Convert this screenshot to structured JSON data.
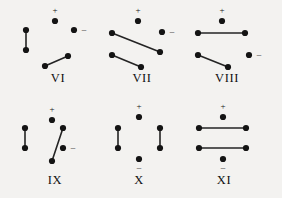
{
  "figure": {
    "background_color": "#f3f2f0",
    "ink_color": "#141414",
    "width": 282,
    "height": 198,
    "panels": [
      {
        "id": "panel-vi",
        "label": "VI",
        "label_x": 58,
        "label_y": 82,
        "plus": {
          "sign": "+",
          "sign_x": 55,
          "sign_y": 11,
          "dot_x": 55,
          "dot_y": 21
        },
        "minus": {
          "sign": "–",
          "sign_x": 84,
          "sign_y": 30,
          "dot_x": 74,
          "dot_y": 30
        },
        "nodes": [
          {
            "x": 26,
            "y": 30
          },
          {
            "x": 26,
            "y": 50
          },
          {
            "x": 45,
            "y": 66
          },
          {
            "x": 68,
            "y": 56
          }
        ],
        "edges": [
          {
            "x1": 26,
            "y1": 30,
            "x2": 26,
            "y2": 50
          },
          {
            "x1": 45,
            "y1": 66,
            "x2": 68,
            "y2": 56
          }
        ]
      },
      {
        "id": "panel-vii",
        "label": "VII",
        "label_x": 142,
        "label_y": 82,
        "plus": {
          "sign": "+",
          "sign_x": 138,
          "sign_y": 11,
          "dot_x": 138,
          "dot_y": 21
        },
        "minus": {
          "sign": "–",
          "sign_x": 172,
          "sign_y": 32,
          "dot_x": 162,
          "dot_y": 32
        },
        "nodes": [
          {
            "x": 112,
            "y": 33
          },
          {
            "x": 160,
            "y": 52
          },
          {
            "x": 112,
            "y": 55
          },
          {
            "x": 141,
            "y": 67
          }
        ],
        "edges": [
          {
            "x1": 112,
            "y1": 33,
            "x2": 160,
            "y2": 52
          },
          {
            "x1": 112,
            "y1": 55,
            "x2": 141,
            "y2": 67
          }
        ]
      },
      {
        "id": "panel-viii",
        "label": "VIII",
        "label_x": 227,
        "label_y": 82,
        "plus": {
          "sign": "+",
          "sign_x": 222,
          "sign_y": 11,
          "dot_x": 222,
          "dot_y": 21
        },
        "minus": {
          "sign": "–",
          "sign_x": 259,
          "sign_y": 55,
          "dot_x": 249,
          "dot_y": 55
        },
        "nodes": [
          {
            "x": 198,
            "y": 33
          },
          {
            "x": 245,
            "y": 33
          },
          {
            "x": 198,
            "y": 55
          },
          {
            "x": 228,
            "y": 67
          }
        ],
        "edges": [
          {
            "x1": 198,
            "y1": 33,
            "x2": 245,
            "y2": 33
          },
          {
            "x1": 198,
            "y1": 55,
            "x2": 228,
            "y2": 67
          }
        ]
      },
      {
        "id": "panel-ix",
        "label": "IX",
        "label_x": 55,
        "label_y": 184,
        "plus": {
          "sign": "+",
          "sign_x": 52,
          "sign_y": 110,
          "dot_x": 52,
          "dot_y": 120
        },
        "minus": {
          "sign": "–",
          "sign_x": 73,
          "sign_y": 148,
          "dot_x": 63,
          "dot_y": 148
        },
        "nodes": [
          {
            "x": 25,
            "y": 128
          },
          {
            "x": 25,
            "y": 148
          },
          {
            "x": 52,
            "y": 161
          },
          {
            "x": 63,
            "y": 128
          }
        ],
        "edges": [
          {
            "x1": 25,
            "y1": 128,
            "x2": 25,
            "y2": 148
          },
          {
            "x1": 52,
            "y1": 161,
            "x2": 63,
            "y2": 128
          }
        ]
      },
      {
        "id": "panel-x",
        "label": "X",
        "label_x": 139,
        "label_y": 184,
        "plus": {
          "sign": "+",
          "sign_x": 139,
          "sign_y": 107,
          "dot_x": 139,
          "dot_y": 117
        },
        "minus": {
          "sign": "–",
          "sign_x": 139,
          "sign_y": 168,
          "dot_x": 139,
          "dot_y": 159
        },
        "nodes": [
          {
            "x": 118,
            "y": 128
          },
          {
            "x": 118,
            "y": 148
          },
          {
            "x": 160,
            "y": 128
          },
          {
            "x": 160,
            "y": 148
          }
        ],
        "edges": [
          {
            "x1": 118,
            "y1": 128,
            "x2": 118,
            "y2": 148
          },
          {
            "x1": 160,
            "y1": 128,
            "x2": 160,
            "y2": 148
          }
        ]
      },
      {
        "id": "panel-xi",
        "label": "XI",
        "label_x": 224,
        "label_y": 184,
        "plus": {
          "sign": "+",
          "sign_x": 223,
          "sign_y": 107,
          "dot_x": 223,
          "dot_y": 117
        },
        "minus": {
          "sign": "–",
          "sign_x": 223,
          "sign_y": 168,
          "dot_x": 223,
          "dot_y": 159
        },
        "nodes": [
          {
            "x": 199,
            "y": 128
          },
          {
            "x": 246,
            "y": 128
          },
          {
            "x": 199,
            "y": 148
          },
          {
            "x": 246,
            "y": 148
          }
        ],
        "edges": [
          {
            "x1": 199,
            "y1": 128,
            "x2": 246,
            "y2": 128
          },
          {
            "x1": 199,
            "y1": 148,
            "x2": 246,
            "y2": 148
          }
        ]
      }
    ]
  }
}
